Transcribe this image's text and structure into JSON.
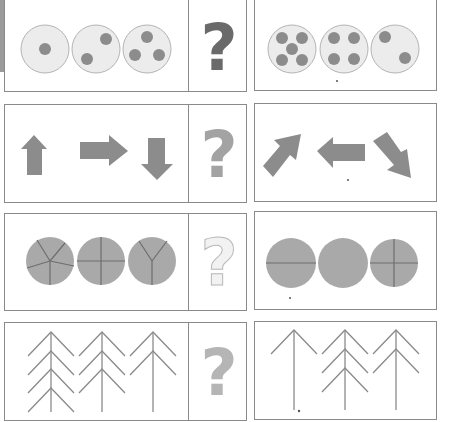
{
  "puzzle": {
    "rows": [
      {
        "id": "dots",
        "sequence": [
          {
            "dots": 1
          },
          {
            "dots": 2
          },
          {
            "dots": 3
          }
        ],
        "answer_placeholder": "?",
        "question_color": "#6a6a6a",
        "options": [
          {
            "dots": 5
          },
          {
            "dots": 4
          },
          {
            "dots": 2
          }
        ]
      },
      {
        "id": "arrows",
        "sequence": [
          {
            "direction": "up"
          },
          {
            "direction": "right"
          },
          {
            "direction": "down"
          }
        ],
        "answer_placeholder": "?",
        "question_color": "#a3a3a3",
        "options": [
          {
            "direction": "up-right"
          },
          {
            "direction": "left"
          },
          {
            "direction": "down-right"
          }
        ]
      },
      {
        "id": "circle-sections",
        "sequence": [
          {
            "sections": 5
          },
          {
            "sections": 4
          },
          {
            "sections": 3
          }
        ],
        "answer_placeholder": "?",
        "question_color": "#e4e4e4",
        "options": [
          {
            "sections": 2
          },
          {
            "sections": 1
          },
          {
            "sections": 4
          }
        ]
      },
      {
        "id": "trees",
        "sequence": [
          {
            "branches": 4
          },
          {
            "branches": 3
          },
          {
            "branches": 2
          }
        ],
        "answer_placeholder": "?",
        "question_color": "#b5b5b5",
        "options": [
          {
            "branches": 1
          },
          {
            "branches": 3
          },
          {
            "branches": 2
          }
        ]
      }
    ]
  },
  "colors": {
    "border": "#8a8a8a",
    "shape_fill": "#8c8c8c",
    "dot_circle_fill": "#ececec",
    "dot_circle_stroke": "#b4b4b4",
    "pie_fill": "#a9a9a9",
    "pie_line": "#6e6e6e",
    "tree_line": "#8a8a8a"
  }
}
